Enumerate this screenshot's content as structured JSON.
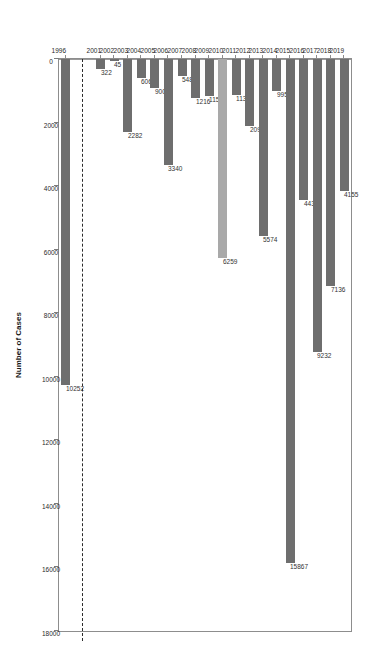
{
  "chart_data": {
    "type": "bar",
    "orientation": "horizontal",
    "title": "",
    "xlabel": "Number of Cases",
    "ylabel": "",
    "xlim": [
      0,
      18000
    ],
    "xticks": [
      0,
      2000,
      4000,
      6000,
      8000,
      10000,
      12000,
      14000,
      16000,
      18000
    ],
    "grid": false,
    "legend": false,
    "axis_break_after_category": "1996",
    "categories": [
      "1996",
      "2001",
      "2002",
      "2003",
      "2004",
      "2005",
      "2006",
      "2007",
      "2008",
      "2009",
      "2010",
      "2011",
      "2012",
      "2013",
      "2014",
      "2015",
      "2016",
      "2017",
      "2018",
      "2019"
    ],
    "values": [
      10252,
      322,
      45,
      2282,
      606,
      900,
      3340,
      548,
      1216,
      1154,
      6259,
      1131,
      2093,
      5574,
      995,
      15867,
      4431,
      9232,
      7136,
      4155
    ],
    "bar_colors": [
      "#6e6e6e",
      "#6e6e6e",
      "#6e6e6e",
      "#6e6e6e",
      "#6e6e6e",
      "#6e6e6e",
      "#6e6e6e",
      "#6e6e6e",
      "#6e6e6e",
      "#6e6e6e",
      "#a9a9a9",
      "#6e6e6e",
      "#6e6e6e",
      "#6e6e6e",
      "#6e6e6e",
      "#6e6e6e",
      "#6e6e6e",
      "#6e6e6e",
      "#6e6e6e",
      "#6e6e6e"
    ],
    "data_labels": [
      "10252",
      "322",
      "45",
      "2282",
      "606",
      "900",
      "3340",
      "548",
      "1216",
      "1154",
      "6259",
      "1131",
      "2093",
      "5574",
      "995",
      "15867",
      "4431",
      "9232",
      "7136",
      "4155"
    ],
    "colors": {
      "bar_dark": "#6e6e6e",
      "bar_light": "#a9a9a9",
      "axis": "#8d8d8d",
      "text": "#2a2a2a",
      "break_line": "#2b2b2b",
      "background": "#ffffff"
    }
  },
  "axis": {
    "x_title": "Number of Cases",
    "tick_labels": [
      "0",
      "2000",
      "4000",
      "6000",
      "8000",
      "10000",
      "12000",
      "14000",
      "16000",
      "18000"
    ],
    "category_labels": [
      "1996",
      "2001",
      "2002",
      "2003",
      "2004",
      "2005",
      "2006",
      "2007",
      "2008",
      "2009",
      "2010",
      "2011",
      "2012",
      "2013",
      "2014",
      "2015",
      "2016",
      "2017",
      "2018",
      "2019"
    ]
  }
}
